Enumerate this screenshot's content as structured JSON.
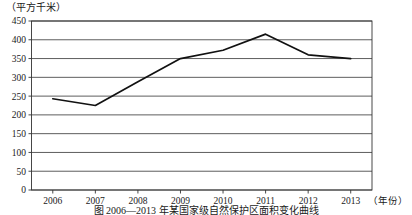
{
  "chart_data": {
    "type": "line",
    "title": "",
    "ylabel": "（平方千米）",
    "xlabel": "（年份）",
    "categories": [
      "2006",
      "2007",
      "2008",
      "2009",
      "2010",
      "2011",
      "2012",
      "2013"
    ],
    "values": [
      243,
      225,
      288,
      350,
      372,
      415,
      360,
      350
    ],
    "series": [
      {
        "name": "面积",
        "values": [
          243,
          225,
          288,
          350,
          372,
          415,
          360,
          350
        ]
      }
    ],
    "ylim": [
      0,
      450
    ],
    "ytick_labels": [
      "0",
      "50",
      "100",
      "150",
      "200",
      "250",
      "300",
      "350",
      "400",
      "450"
    ],
    "ytick_values": [
      0,
      50,
      100,
      150,
      200,
      250,
      300,
      350,
      400,
      450
    ],
    "grid": true,
    "grid_axis": "y",
    "legend": false,
    "line_color": "#111111"
  },
  "caption": {
    "text": "图 2006—2013 年某国家级自然保护区面积变化曲线"
  }
}
